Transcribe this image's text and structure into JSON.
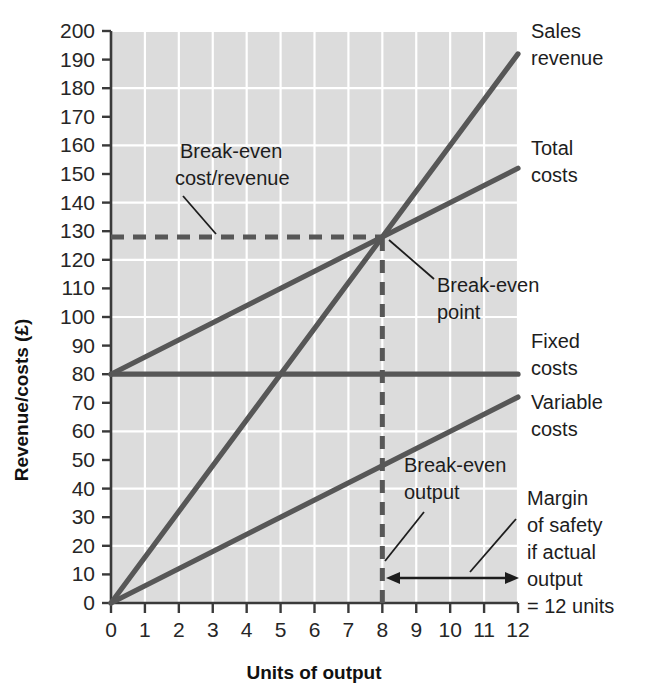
{
  "chart_data": {
    "type": "line",
    "title": "",
    "xlabel": "Units of output",
    "ylabel": "Revenue/costs (£)",
    "xlim": [
      0,
      12
    ],
    "ylim": [
      0,
      200
    ],
    "xticks": [
      "0",
      "1",
      "2",
      "3",
      "4",
      "5",
      "6",
      "7",
      "8",
      "9",
      "10",
      "11",
      "12"
    ],
    "yticks": [
      "0",
      "10",
      "20",
      "30",
      "40",
      "50",
      "60",
      "70",
      "80",
      "90",
      "100",
      "110",
      "120",
      "130",
      "140",
      "150",
      "160",
      "170",
      "180",
      "190",
      "200"
    ],
    "grid": true,
    "legend_position": "right-inline-labels",
    "series": [
      {
        "name": "Sales revenue",
        "type": "line",
        "x": [
          0,
          12
        ],
        "values": [
          0,
          192
        ],
        "color": "#575757"
      },
      {
        "name": "Total costs",
        "type": "line",
        "x": [
          0,
          12
        ],
        "values": [
          80,
          152
        ],
        "color": "#575757"
      },
      {
        "name": "Fixed costs",
        "type": "line",
        "x": [
          0,
          12
        ],
        "values": [
          80,
          80
        ],
        "color": "#575757"
      },
      {
        "name": "Variable costs",
        "type": "line",
        "x": [
          0,
          12
        ],
        "values": [
          0,
          72
        ],
        "color": "#575757"
      }
    ],
    "annotations": [
      {
        "id": "break-even-cost-revenue",
        "text": "Break-even cost/revenue",
        "lines": [
          "Break-even",
          "cost/revenue"
        ],
        "points_to_value": 128
      },
      {
        "id": "break-even-point",
        "text": "Break-even point",
        "lines": [
          "Break-even",
          "point"
        ],
        "points_to_x": 8,
        "points_to_y": 128
      },
      {
        "id": "break-even-output",
        "text": "Break-even output",
        "lines": [
          "Break-even",
          "output"
        ],
        "points_to_x": 8
      },
      {
        "id": "margin-of-safety",
        "text": "Margin of safety if actual output = 12 units",
        "lines": [
          "Margin",
          "of safety",
          "if actual",
          "output",
          "= 12 units"
        ],
        "range_x": [
          8,
          12
        ]
      }
    ],
    "reference_lines": [
      {
        "id": "break-even-horizontal",
        "orientation": "horizontal",
        "value": 128,
        "style": "dashed",
        "from_x": 0,
        "to_x": 8
      },
      {
        "id": "break-even-vertical",
        "orientation": "vertical",
        "value": 8,
        "style": "dashed",
        "from_y": 0,
        "to_y": 128
      }
    ],
    "colors": {
      "plot_background": "#dcdcdc",
      "gridline": "#ffffff",
      "series_line": "#575757",
      "axis": "#3a3a3a",
      "text": "#1d1d1d"
    }
  },
  "axis": {
    "x_title": "Units of output",
    "y_title": "Revenue/costs (£)"
  },
  "series_labels": {
    "sales_revenue": [
      "Sales",
      "revenue"
    ],
    "total_costs": [
      "Total",
      "costs"
    ],
    "fixed_costs": [
      "Fixed",
      "costs"
    ],
    "variable_costs": [
      "Variable",
      "costs"
    ]
  },
  "annotation_text": {
    "break_even_cost_revenue": [
      "Break-even",
      "cost/revenue"
    ],
    "break_even_point": [
      "Break-even",
      "point"
    ],
    "break_even_output": [
      "Break-even",
      "output"
    ],
    "margin_of_safety": [
      "Margin",
      "of safety",
      "if actual",
      "output",
      "= 12 units"
    ]
  },
  "ticks": {
    "y": [
      "200",
      "190",
      "180",
      "170",
      "160",
      "150",
      "140",
      "130",
      "120",
      "110",
      "100",
      "90",
      "80",
      "70",
      "60",
      "50",
      "40",
      "30",
      "20",
      "10",
      "0"
    ],
    "x": [
      "0",
      "1",
      "2",
      "3",
      "4",
      "5",
      "6",
      "7",
      "8",
      "9",
      "10",
      "11",
      "12"
    ]
  }
}
